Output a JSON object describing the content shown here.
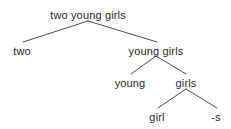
{
  "figure": {
    "kind": "syntactic-morphological-tree",
    "background_color": "#ffffff",
    "text_color": "#2b2b2b",
    "edge_color": "#3a3a3a",
    "width": 231,
    "height": 129
  },
  "nodes": [
    {
      "id": "root",
      "label": "two young girls",
      "x": 88,
      "y": 10,
      "type": "phrase"
    },
    {
      "id": "two",
      "label": "two",
      "x": 22,
      "y": 46,
      "type": "leaf"
    },
    {
      "id": "young-girls",
      "label": "young girls",
      "x": 156,
      "y": 46,
      "type": "phrase"
    },
    {
      "id": "young",
      "label": "young",
      "x": 130,
      "y": 78,
      "type": "leaf"
    },
    {
      "id": "girls",
      "label": "girls",
      "x": 186,
      "y": 78,
      "type": "phrase"
    },
    {
      "id": "girl",
      "label": "girl",
      "x": 157,
      "y": 112,
      "type": "leaf"
    },
    {
      "id": "suffix-s",
      "label": "-s",
      "x": 216,
      "y": 112,
      "type": "leaf"
    }
  ],
  "edges": [
    {
      "id": "root-two",
      "from": "root",
      "to": "two",
      "x1": 88,
      "y1": 21,
      "x2": 23,
      "y2": 42
    },
    {
      "id": "root-young-girls",
      "from": "root",
      "to": "young-girls",
      "x1": 88,
      "y1": 21,
      "x2": 157,
      "y2": 42
    },
    {
      "id": "yg-young",
      "from": "young-girls",
      "to": "young",
      "x1": 156,
      "y1": 56,
      "x2": 131,
      "y2": 74
    },
    {
      "id": "yg-girls",
      "from": "young-girls",
      "to": "girls",
      "x1": 156,
      "y1": 56,
      "x2": 186,
      "y2": 74
    },
    {
      "id": "girls-girl",
      "from": "girls",
      "to": "girl",
      "x1": 186,
      "y1": 89,
      "x2": 158,
      "y2": 108
    },
    {
      "id": "girls-suffix",
      "from": "girls",
      "to": "suffix-s",
      "x1": 186,
      "y1": 89,
      "x2": 217,
      "y2": 108
    }
  ]
}
